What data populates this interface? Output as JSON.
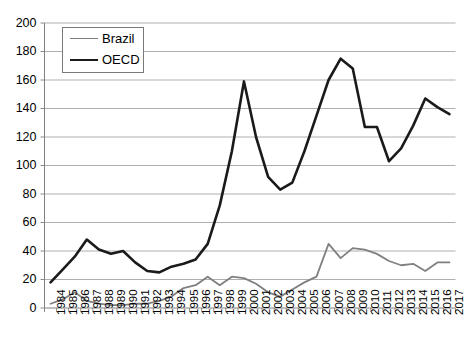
{
  "chart_data": {
    "type": "line",
    "title": "",
    "subtitle": "",
    "xlabel": "",
    "ylabel": "",
    "grid": true,
    "legend_position": "top-left",
    "ylim": [
      0,
      200
    ],
    "ytick_step": 20,
    "ytick_labels": [
      "0",
      "20",
      "40",
      "60",
      "80",
      "100",
      "120",
      "140",
      "160",
      "180",
      "200"
    ],
    "categories": [
      "1984",
      "1985",
      "1986",
      "1987",
      "1988",
      "1989",
      "1990",
      "1991",
      "1992",
      "1993",
      "1994",
      "1995",
      "1996",
      "1997",
      "1998",
      "1999",
      "2000",
      "2001",
      "2002",
      "2003",
      "2004",
      "2005",
      "2006",
      "2007",
      "2008",
      "2009",
      "2010",
      "2011",
      "2012",
      "2013",
      "2014",
      "2015",
      "2016",
      "2017"
    ],
    "series": [
      {
        "name": "Brazil",
        "color": "#808080",
        "width": 1.8,
        "values": [
          3,
          6,
          11,
          5,
          3,
          2,
          2,
          3,
          3,
          5,
          8,
          14,
          16,
          22,
          16,
          22,
          21,
          17,
          11,
          8,
          13,
          18,
          22,
          45,
          35,
          42,
          41,
          38,
          33,
          30,
          31,
          26,
          32,
          32
        ]
      },
      {
        "name": "OECD",
        "color": "#1a1a1a",
        "width": 2.6,
        "values": [
          18,
          27,
          36,
          48,
          41,
          38,
          40,
          32,
          26,
          25,
          29,
          31,
          34,
          45,
          72,
          110,
          159,
          120,
          92,
          83,
          88,
          110,
          135,
          160,
          175,
          168,
          127,
          127,
          103,
          112,
          128,
          147,
          141,
          136
        ]
      }
    ]
  },
  "legend": {
    "items": [
      {
        "label": "Brazil",
        "color": "#808080",
        "width": 1.8
      },
      {
        "label": "OECD",
        "color": "#1a1a1a",
        "width": 2.8
      }
    ]
  },
  "axes": {
    "y_max": 200,
    "y_min": 0,
    "x_first": "1984",
    "x_last": "2017"
  }
}
